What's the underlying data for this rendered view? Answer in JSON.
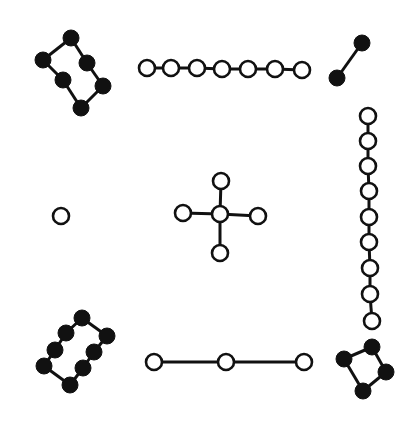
{
  "diagram": {
    "title": "",
    "style": {
      "ink": "#111111",
      "paper": "#ffffff",
      "dot_radius": 8,
      "stroke_width": 3
    },
    "groups": [
      {
        "name": "top-left",
        "count": 6,
        "fill": "black",
        "closed": true,
        "points": [
          [
            71,
            38
          ],
          [
            87,
            63
          ],
          [
            103,
            86
          ],
          [
            81,
            108
          ],
          [
            63,
            80
          ],
          [
            43,
            60
          ]
        ]
      },
      {
        "name": "top",
        "count": 7,
        "fill": "white",
        "closed": false,
        "points": [
          [
            147,
            68
          ],
          [
            171,
            68
          ],
          [
            197,
            68
          ],
          [
            222,
            69
          ],
          [
            248,
            69
          ],
          [
            275,
            69
          ],
          [
            302,
            70
          ]
        ]
      },
      {
        "name": "top-right",
        "count": 2,
        "fill": "black",
        "closed": false,
        "points": [
          [
            362,
            43
          ],
          [
            337,
            78
          ]
        ]
      },
      {
        "name": "left",
        "count": 1,
        "fill": "white",
        "closed": false,
        "points": [
          [
            61,
            216
          ]
        ]
      },
      {
        "name": "center",
        "count": 5,
        "fill": "white",
        "closed": false,
        "star": true,
        "points": [
          [
            220,
            214
          ],
          [
            221,
            181
          ],
          [
            183,
            213
          ],
          [
            258,
            216
          ],
          [
            220,
            253
          ]
        ]
      },
      {
        "name": "right",
        "count": 9,
        "fill": "white",
        "closed": false,
        "points": [
          [
            368,
            116
          ],
          [
            368,
            141
          ],
          [
            368,
            166
          ],
          [
            369,
            191
          ],
          [
            369,
            217
          ],
          [
            369,
            242
          ],
          [
            370,
            268
          ],
          [
            370,
            294
          ],
          [
            372,
            321
          ]
        ]
      },
      {
        "name": "bottom-left",
        "count": 8,
        "fill": "black",
        "closed": true,
        "points": [
          [
            82,
            318
          ],
          [
            107,
            336
          ],
          [
            94,
            352
          ],
          [
            83,
            368
          ],
          [
            70,
            385
          ],
          [
            44,
            366
          ],
          [
            55,
            350
          ],
          [
            66,
            333
          ]
        ]
      },
      {
        "name": "bottom",
        "count": 3,
        "fill": "white",
        "closed": false,
        "points": [
          [
            154,
            362
          ],
          [
            226,
            362
          ],
          [
            304,
            362
          ]
        ]
      },
      {
        "name": "bottom-right",
        "count": 4,
        "fill": "black",
        "closed": true,
        "points": [
          [
            372,
            347
          ],
          [
            386,
            372
          ],
          [
            363,
            391
          ],
          [
            344,
            359
          ]
        ]
      }
    ]
  }
}
